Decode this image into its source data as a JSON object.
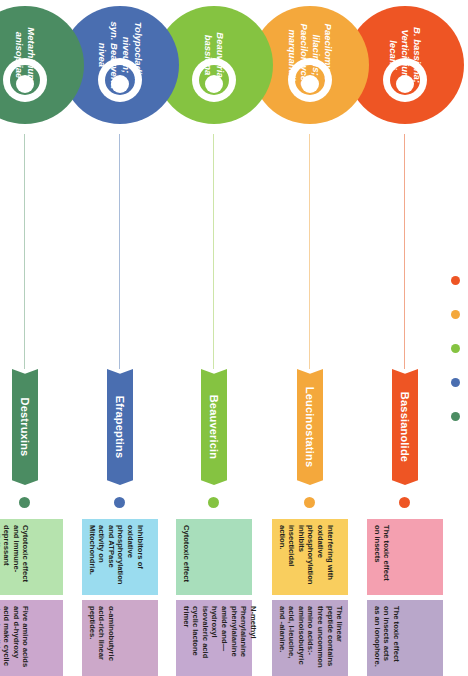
{
  "meta": {
    "orientation": "rotated-90-clockwise"
  },
  "legend": {
    "name": "color-legend",
    "dots": [
      {
        "label": "orange-red",
        "color": "#ee5524"
      },
      {
        "label": "amber",
        "color": "#f4a83c"
      },
      {
        "label": "light-green",
        "color": "#85c341"
      },
      {
        "label": "blue",
        "color": "#4a6eb0"
      },
      {
        "label": "dark-green",
        "color": "#4b8c62"
      }
    ]
  },
  "rows": [
    {
      "id": "row-bassianolide",
      "color": "#ee5524",
      "line_color": "#f2a88c",
      "organism": "B. bassiana;\nVerticillium\nlecanii",
      "metabolite": "Bassianolide",
      "boxes": [
        {
          "text": "The toxic effect on insects",
          "color": "#f4a0b0"
        },
        {
          "text": "The toxic effect on insects acts as an ionophore.",
          "color": "#b9a7ca"
        }
      ]
    },
    {
      "id": "row-leucinostatins",
      "color": "#f4a83c",
      "line_color": "#f7d2a0",
      "organism": "Paecilomyces\nlilacinus;\nPaecilomyces\nmarquandii",
      "metabolite": "Leucinostatins",
      "boxes": [
        {
          "text": "Interfering with oxidative phosphorylation inhibits insecticidal action.",
          "color": "#f9ce5e"
        },
        {
          "text": "The linear peptide contains three uncommon amino acids:-aminoisobutyric acid, l-leucine, and -alanine.",
          "color": "#bda7cb"
        }
      ]
    },
    {
      "id": "row-beauvericin",
      "color": "#85c341",
      "line_color": "#cde5a8",
      "organism": "Beauveria\nbassiana",
      "metabolite": "Beauvericin",
      "boxes": [
        {
          "text": "Cytotoxic effect",
          "color": "#a8debb"
        },
        {
          "text": "N-methyl Phenylalanine phenylalanine amide and—hydroxyl isovaleric acid cyclic lactone trimer",
          "color": "#c4a9d0"
        }
      ]
    },
    {
      "id": "row-efrapeptins",
      "color": "#4a6eb0",
      "line_color": "#a9bcd9",
      "organism": "Tolypocladium\nniveum;\nsyn. Beauveria\nnivea",
      "metabolite": "Efrapeptins",
      "boxes": [
        {
          "text": "Inhibitors of oxidative phosphorylation and ATPase activity on Mitochondria.",
          "color": "#9adcef"
        },
        {
          "text": "α-aminobutyric acid-rich linear peptides.",
          "color": "#cca8c9"
        }
      ]
    },
    {
      "id": "row-destruxins",
      "color": "#4b8c62",
      "line_color": "#b3cfbc",
      "organism": "Metarhizium\nanisopliae",
      "metabolite": "Destruxins",
      "boxes": [
        {
          "text": "Cytotoxic effect and immune-depressant activity.",
          "color": "#b6e3ae"
        },
        {
          "text": "Five amino acids and d-hydroxy acid make cyclic depsipeptides.",
          "color": "#cba7cd"
        }
      ]
    }
  ]
}
